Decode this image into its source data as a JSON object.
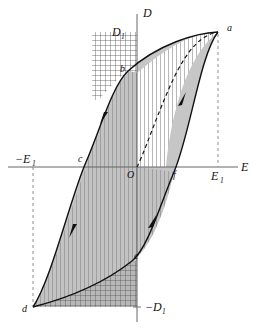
{
  "figure": {
    "background_color": "#ffffff",
    "curve_color": "#1a1a1a",
    "axis_color": "#555555",
    "dashed_color": "#888888",
    "shade_fill": "#bfbfbf",
    "hatch_color": "#4d4d4d"
  },
  "axes": {
    "vertical": {
      "name": "D",
      "label": "D",
      "top_tick_label": "D",
      "top_tick_sub": "1",
      "bottom_tick_prefix": "−",
      "bottom_tick_label": "D",
      "bottom_tick_sub": "1"
    },
    "horizontal": {
      "name": "E",
      "label": "E",
      "right_tick_label": "E",
      "right_tick_sub": "1",
      "left_tick_prefix": "−",
      "left_tick_label": "E",
      "left_tick_sub": "1"
    },
    "origin_label": "O"
  },
  "points": [
    {
      "id": "a",
      "label": "a",
      "x": 218,
      "y": 32,
      "desc": "saturation at +E1"
    },
    {
      "id": "b",
      "label": "b",
      "x": 128,
      "y": 71,
      "desc": "remanent polarization +D1"
    },
    {
      "id": "c",
      "label": "c",
      "x": 86,
      "y": 162,
      "desc": "coercive field negative"
    },
    {
      "id": "d",
      "label": "d",
      "x": 33,
      "y": 307,
      "desc": "saturation at -E1"
    },
    {
      "id": "e",
      "label": "e",
      "x": 132,
      "y": 261,
      "desc": "remanent polarization -D1"
    },
    {
      "id": "f",
      "label": "f",
      "x": 174,
      "y": 172,
      "desc": "coercive field positive"
    }
  ],
  "curves": {
    "virgin": {
      "name": "virgin-curve",
      "style": "dashed",
      "from": "O",
      "to": "a"
    },
    "upper_branch": {
      "name": "upper-branch",
      "style": "solid",
      "path": "a-b-c-d"
    },
    "lower_branch": {
      "name": "lower-branch",
      "style": "solid",
      "path": "d-e-f-a"
    }
  },
  "arrows": [
    {
      "on": "upper-branch",
      "x": 104,
      "y": 118,
      "direction": "down-left"
    },
    {
      "on": "upper-branch",
      "x": 73,
      "y": 231,
      "direction": "down-left"
    },
    {
      "on": "lower-branch",
      "x": 181,
      "y": 98,
      "direction": "up-right"
    },
    {
      "on": "lower-branch",
      "x": 152,
      "y": 219,
      "direction": "up-right"
    }
  ],
  "regions": [
    {
      "name": "upper-crosshatch",
      "pattern": "cross-hatch",
      "desc": "above curve b-a, left of D axis up to D1"
    },
    {
      "name": "upper-vertical-hatch",
      "pattern": "vertical-hatch",
      "desc": "right of D axis between virgin curve and branch"
    },
    {
      "name": "loop-shade",
      "pattern": "solid-gray",
      "desc": "interior of hysteresis loop"
    },
    {
      "name": "lower-crosshatch",
      "pattern": "cross-hatch",
      "desc": "below curve d-e, right to D axis down to -D1"
    }
  ],
  "dashed_guides": [
    {
      "name": "guide-E1-right",
      "from_point": "a",
      "to_axis": "E1"
    },
    {
      "name": "guide-E1-left",
      "from_point": "d",
      "to_axis": "-E1"
    }
  ]
}
